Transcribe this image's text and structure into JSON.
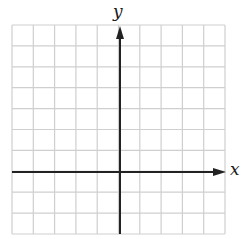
{
  "diagram": {
    "type": "coordinate-grid",
    "grid": {
      "columns": 10,
      "rows": 10,
      "left": 12,
      "top": 25,
      "right": 225,
      "bottom": 234,
      "line_color": "#cfcfcf"
    },
    "axes": {
      "color": "#222222",
      "x_axis": {
        "label": "x",
        "y_position": 172,
        "x_start": 12,
        "x_end": 226,
        "arrow": "right"
      },
      "y_axis": {
        "label": "y",
        "x_position": 120,
        "y_start": 234,
        "y_end": 26,
        "arrow": "up"
      }
    }
  }
}
